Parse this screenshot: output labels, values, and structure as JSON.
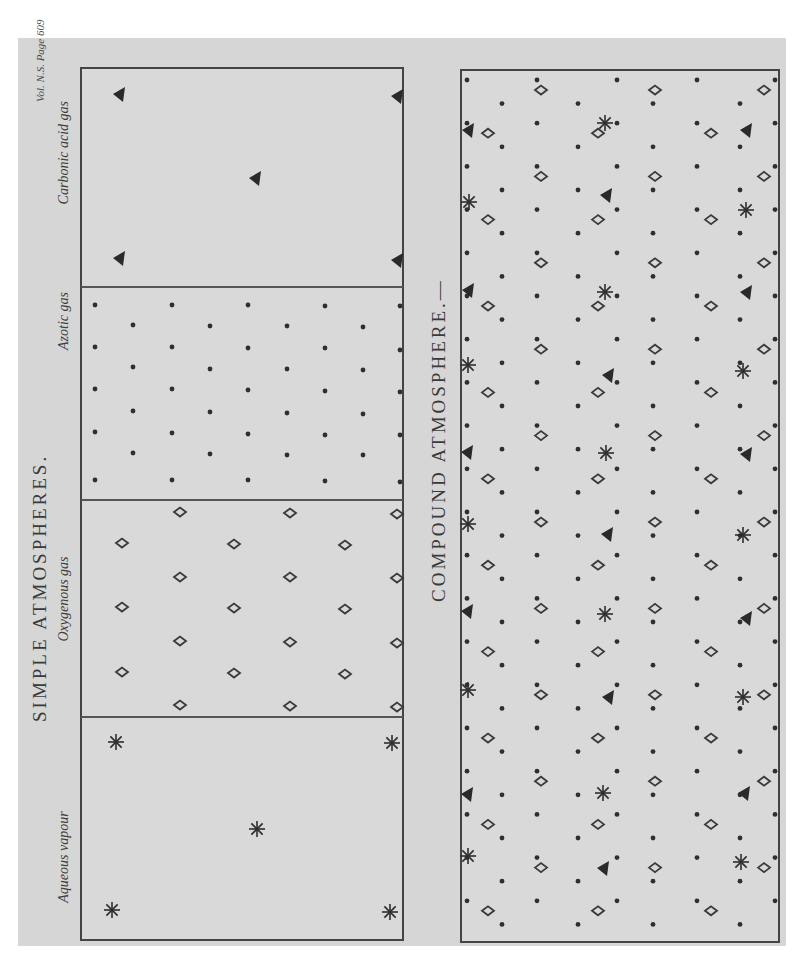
{
  "plate": {
    "reference": "Vol. N.S. Page 609",
    "background": "#d7d7d7",
    "ink": "#2f2f2f"
  },
  "simple": {
    "title": "SIMPLE ATMOSPHERES.",
    "frame": {
      "x": 81,
      "y": 68,
      "w": 322,
      "h": 872
    },
    "sections": [
      {
        "id": "carbonic",
        "label": "Carbonic acid gas",
        "glyph": "triangle",
        "y0": 68,
        "y1": 287,
        "label_y": 150,
        "points": [
          [
            120,
            94
          ],
          [
            398,
            96
          ],
          [
            256,
            178
          ],
          [
            120,
            258
          ],
          [
            398,
            260
          ]
        ]
      },
      {
        "id": "azotic",
        "label": "Azotic gas",
        "glyph": "dot",
        "y0": 287,
        "y1": 500,
        "label_y": 318,
        "points": [
          [
            95,
            305
          ],
          [
            172,
            305
          ],
          [
            248,
            305
          ],
          [
            325,
            306
          ],
          [
            400,
            306
          ],
          [
            133,
            325
          ],
          [
            210,
            326
          ],
          [
            287,
            326
          ],
          [
            363,
            327
          ],
          [
            95,
            347
          ],
          [
            172,
            347
          ],
          [
            248,
            348
          ],
          [
            325,
            348
          ],
          [
            400,
            350
          ],
          [
            133,
            367
          ],
          [
            210,
            369
          ],
          [
            287,
            369
          ],
          [
            363,
            370
          ],
          [
            95,
            389
          ],
          [
            172,
            389
          ],
          [
            248,
            390
          ],
          [
            325,
            391
          ],
          [
            400,
            392
          ],
          [
            133,
            411
          ],
          [
            210,
            412
          ],
          [
            287,
            413
          ],
          [
            363,
            414
          ],
          [
            95,
            432
          ],
          [
            172,
            433
          ],
          [
            248,
            434
          ],
          [
            325,
            435
          ],
          [
            400,
            435
          ],
          [
            133,
            453
          ],
          [
            210,
            454
          ],
          [
            287,
            455
          ],
          [
            363,
            455
          ],
          [
            95,
            480
          ],
          [
            172,
            480
          ],
          [
            248,
            480
          ],
          [
            325,
            481
          ],
          [
            400,
            482
          ]
        ]
      },
      {
        "id": "oxygenous",
        "label": "Oxygenous gas",
        "glyph": "diamond",
        "y0": 500,
        "y1": 717,
        "label_y": 600,
        "points": [
          [
            180,
            512
          ],
          [
            290,
            513
          ],
          [
            397,
            514
          ],
          [
            122,
            543
          ],
          [
            234,
            544
          ],
          [
            345,
            545
          ],
          [
            180,
            577
          ],
          [
            290,
            577
          ],
          [
            397,
            578
          ],
          [
            122,
            607
          ],
          [
            234,
            608
          ],
          [
            345,
            609
          ],
          [
            180,
            641
          ],
          [
            290,
            642
          ],
          [
            397,
            643
          ],
          [
            122,
            672
          ],
          [
            234,
            673
          ],
          [
            345,
            674
          ],
          [
            180,
            705
          ],
          [
            290,
            706
          ],
          [
            397,
            707
          ]
        ]
      },
      {
        "id": "aqueous",
        "label": "Aqueous vapour",
        "glyph": "star",
        "y0": 717,
        "y1": 940,
        "label_y": 858,
        "points": [
          [
            116,
            742
          ],
          [
            392,
            743
          ],
          [
            257,
            829
          ],
          [
            112,
            910
          ],
          [
            390,
            912
          ]
        ]
      }
    ]
  },
  "compound": {
    "title": "COMPOUND ATMOSPHERE.—",
    "frame": {
      "x": 461,
      "y": 70,
      "w": 318,
      "h": 872
    },
    "columns": {
      "dots_a": [
        467,
        537,
        617,
        697,
        775
      ],
      "dots_b": [
        502,
        578,
        653,
        740
      ],
      "diamonds_a": [
        541,
        655,
        764
      ],
      "diamonds_b": [
        488,
        598,
        711
      ],
      "specials": [
        468,
        606,
        745
      ]
    },
    "row_step": 21.6,
    "row_start": 80,
    "row_count": 40,
    "specials": [
      {
        "x": 469,
        "y": 130,
        "type": "triangle"
      },
      {
        "x": 605,
        "y": 123,
        "type": "star"
      },
      {
        "x": 747,
        "y": 130,
        "type": "triangle"
      },
      {
        "x": 469,
        "y": 202,
        "type": "star"
      },
      {
        "x": 607,
        "y": 195,
        "type": "triangle"
      },
      {
        "x": 746,
        "y": 210,
        "type": "star"
      },
      {
        "x": 469,
        "y": 290,
        "type": "triangle"
      },
      {
        "x": 605,
        "y": 292,
        "type": "star"
      },
      {
        "x": 747,
        "y": 292,
        "type": "triangle"
      },
      {
        "x": 468,
        "y": 365,
        "type": "star"
      },
      {
        "x": 609,
        "y": 375,
        "type": "triangle"
      },
      {
        "x": 743,
        "y": 371,
        "type": "star"
      },
      {
        "x": 468,
        "y": 452,
        "type": "triangle"
      },
      {
        "x": 606,
        "y": 453,
        "type": "star"
      },
      {
        "x": 747,
        "y": 454,
        "type": "triangle"
      },
      {
        "x": 468,
        "y": 524,
        "type": "star"
      },
      {
        "x": 608,
        "y": 534,
        "type": "triangle"
      },
      {
        "x": 743,
        "y": 535,
        "type": "star"
      },
      {
        "x": 468,
        "y": 611,
        "type": "triangle"
      },
      {
        "x": 605,
        "y": 614,
        "type": "star"
      },
      {
        "x": 747,
        "y": 618,
        "type": "triangle"
      },
      {
        "x": 468,
        "y": 690,
        "type": "star"
      },
      {
        "x": 609,
        "y": 697,
        "type": "triangle"
      },
      {
        "x": 743,
        "y": 697,
        "type": "star"
      },
      {
        "x": 468,
        "y": 794,
        "type": "triangle"
      },
      {
        "x": 603,
        "y": 793,
        "type": "star"
      },
      {
        "x": 745,
        "y": 793,
        "type": "triangle"
      },
      {
        "x": 468,
        "y": 856,
        "type": "star"
      },
      {
        "x": 604,
        "y": 868,
        "type": "triangle"
      },
      {
        "x": 741,
        "y": 862,
        "type": "star"
      }
    ]
  }
}
